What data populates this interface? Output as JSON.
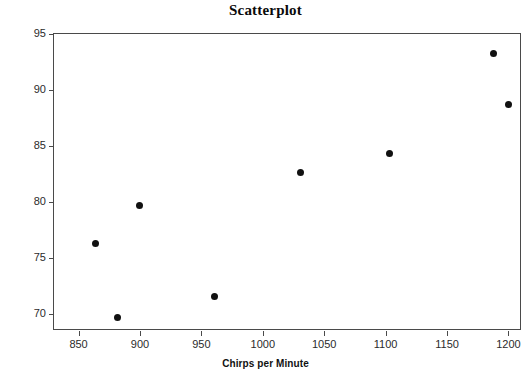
{
  "chart_data": {
    "type": "scatter",
    "title": "Scatterplot",
    "xlabel": "Chirps per Minute",
    "ylabel": "Temperature",
    "xlim": [
      830,
      1211
    ],
    "ylim": [
      68.5,
      95.0
    ],
    "xticks": [
      850,
      900,
      950,
      1000,
      1050,
      1100,
      1150,
      1200
    ],
    "yticks": [
      70,
      75,
      80,
      85,
      90,
      95
    ],
    "grid": false,
    "legend": null,
    "marker": "filled-circle",
    "marker_color": "#111111",
    "x": [
      864,
      882,
      900,
      961,
      1031,
      1103,
      1188,
      1200
    ],
    "y": [
      76.3,
      69.7,
      79.7,
      71.6,
      82.6,
      84.3,
      93.3,
      88.7
    ],
    "points": [
      {
        "x": 864,
        "y": 76.3
      },
      {
        "x": 882,
        "y": 69.7
      },
      {
        "x": 900,
        "y": 79.7
      },
      {
        "x": 961,
        "y": 71.6
      },
      {
        "x": 1031,
        "y": 82.6
      },
      {
        "x": 1103,
        "y": 84.3
      },
      {
        "x": 1188,
        "y": 93.3
      },
      {
        "x": 1200,
        "y": 88.7
      }
    ]
  },
  "figure": {
    "title": "Scatterplot",
    "xlabel": "Chirps per Minute",
    "ylabel": "Temperature",
    "frame_color": "#4a4a4a",
    "background": "#ffffff"
  }
}
